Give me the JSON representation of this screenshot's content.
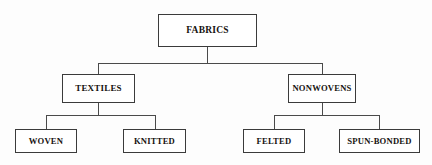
{
  "diagram": {
    "type": "hierarchy-tree",
    "orientation": "top-down",
    "levels": 3,
    "background_color": "#ffffff",
    "box_border_color": "#3b3b3b",
    "connector_color": "#4a4a4a",
    "text_color": "#16120f",
    "nodes": {
      "root": {
        "id": "fabrics",
        "label": "FABRICS",
        "level": 1
      },
      "level2": [
        {
          "id": "textiles",
          "label": "TEXTILES",
          "level": 2,
          "parent": "fabrics"
        },
        {
          "id": "nonwovens",
          "label": "NONWOVENS",
          "level": 2,
          "parent": "fabrics"
        }
      ],
      "level3": [
        {
          "id": "woven",
          "label": "WOVEN",
          "level": 3,
          "parent": "textiles"
        },
        {
          "id": "knitted",
          "label": "KNITTED",
          "level": 3,
          "parent": "textiles"
        },
        {
          "id": "felted",
          "label": "FELTED",
          "level": 3,
          "parent": "nonwovens"
        },
        {
          "id": "spun-bonded",
          "label": "SPUN-BONDED",
          "level": 3,
          "parent": "nonwovens"
        }
      ]
    },
    "edges": [
      {
        "from": "fabrics",
        "to": "textiles"
      },
      {
        "from": "fabrics",
        "to": "nonwovens"
      },
      {
        "from": "textiles",
        "to": "woven"
      },
      {
        "from": "textiles",
        "to": "knitted"
      },
      {
        "from": "nonwovens",
        "to": "felted"
      },
      {
        "from": "nonwovens",
        "to": "spun-bonded"
      }
    ]
  }
}
